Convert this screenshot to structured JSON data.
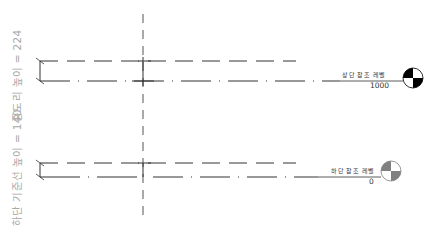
{
  "diagram": {
    "dimensions": [
      {
        "id": "purlin-height",
        "label": "중도리 높이 = 224"
      },
      {
        "id": "base-line-height",
        "label": "하단 기준선 높이 = 140"
      }
    ],
    "levels": [
      {
        "id": "top-reference-level",
        "name": "상단 참조 레벨",
        "elevation": "1000",
        "fill_color": "#000000"
      },
      {
        "id": "bottom-reference-level",
        "name": "하단 참조 레벨",
        "elevation": "0",
        "fill_color": "#808080"
      }
    ],
    "colors": {
      "line": "#333333",
      "dim_text": "#a8a8a8",
      "background": "#ffffff"
    }
  }
}
